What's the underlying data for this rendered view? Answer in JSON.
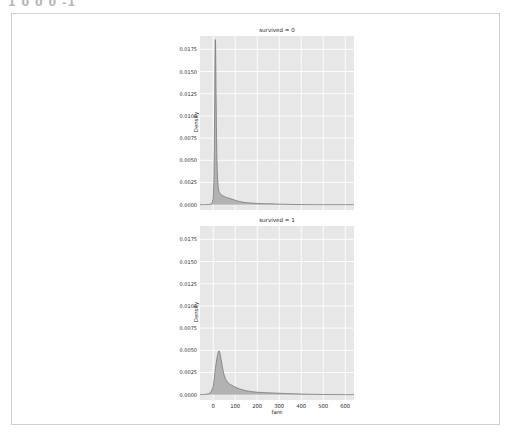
{
  "document": {
    "header_text": "1 0 0  0 -1",
    "background_color": "#ffffff",
    "frame_border_color": "#cfcfcf"
  },
  "chart_data": {
    "type": "area",
    "title": "",
    "xlabel": "fare",
    "ylabel": "Density",
    "xlim": [
      -60,
      640
    ],
    "ylim": [
      -0.0006,
      0.019
    ],
    "grid": true,
    "grid_color": "#ffffff",
    "panel_color": "#e7e7e7",
    "fill_color": "#a8a8a8",
    "line_color": "#7a7a7a",
    "legend_position": "none",
    "xticks": [
      0,
      100,
      200,
      300,
      400,
      500,
      600
    ],
    "xtick_labels": [
      "0",
      "100",
      "200",
      "300",
      "400",
      "500",
      "600"
    ],
    "yticks": [
      0.0,
      0.0025,
      0.005,
      0.0075,
      0.01,
      0.0125,
      0.015,
      0.0175
    ],
    "ytick_labels": [
      "0.0000",
      "0.0025",
      "0.0050",
      "0.0075",
      "0.0100",
      "0.0125",
      "0.0150",
      "0.0175"
    ],
    "facets": [
      {
        "title": "survived = 0",
        "series_name": "survived = 0",
        "x": [
          -60,
          -40,
          -20,
          -10,
          -5,
          0,
          3,
          5,
          7,
          8,
          9,
          10,
          11,
          12,
          13,
          15,
          17,
          20,
          23,
          26,
          30,
          35,
          40,
          45,
          50,
          55,
          60,
          65,
          70,
          75,
          80,
          90,
          100,
          110,
          120,
          130,
          140,
          150,
          170,
          200,
          230,
          250,
          263,
          280,
          300,
          350,
          400,
          450,
          500,
          512,
          550,
          600,
          640
        ],
        "y": [
          0.0,
          0.0,
          2e-05,
          8e-05,
          0.0002,
          0.0007,
          0.0025,
          0.006,
          0.012,
          0.0158,
          0.018,
          0.0186,
          0.0178,
          0.0155,
          0.0125,
          0.008,
          0.005,
          0.0028,
          0.0019,
          0.0015,
          0.0013,
          0.00115,
          0.00105,
          0.00098,
          0.00092,
          0.00086,
          0.00082,
          0.00078,
          0.00074,
          0.0007,
          0.00066,
          0.00058,
          0.0005,
          0.00042,
          0.00035,
          0.0003,
          0.00026,
          0.00023,
          0.00019,
          0.00014,
          0.00011,
          0.0001,
          0.0001,
          8e-05,
          6e-05,
          3e-05,
          1e-05,
          4e-06,
          2e-06,
          2e-06,
          1e-06,
          0.0,
          0.0
        ]
      },
      {
        "title": "survived = 1",
        "series_name": "survived = 1",
        "x": [
          -60,
          -40,
          -20,
          -10,
          0,
          5,
          8,
          10,
          13,
          16,
          20,
          24,
          26,
          28,
          30,
          33,
          36,
          40,
          45,
          50,
          55,
          60,
          65,
          70,
          75,
          80,
          90,
          100,
          110,
          120,
          130,
          140,
          150,
          170,
          190,
          210,
          230,
          250,
          263,
          290,
          320,
          350,
          400,
          450,
          500,
          512,
          550,
          600,
          640
        ],
        "y": [
          0.0,
          2e-05,
          0.0001,
          0.0003,
          0.0009,
          0.0018,
          0.0025,
          0.0029,
          0.0035,
          0.004,
          0.0045,
          0.00488,
          0.00495,
          0.0049,
          0.00475,
          0.0044,
          0.00395,
          0.00335,
          0.0027,
          0.0022,
          0.00185,
          0.0016,
          0.00143,
          0.0013,
          0.0012,
          0.00112,
          0.00098,
          0.00086,
          0.00075,
          0.00065,
          0.00057,
          0.0005,
          0.00044,
          0.00036,
          0.0003,
          0.00026,
          0.00023,
          0.00021,
          0.0002,
          0.00017,
          0.00014,
          0.00011,
          7e-05,
          4e-05,
          2e-05,
          2e-05,
          1e-05,
          0.0,
          0.0
        ]
      }
    ]
  }
}
